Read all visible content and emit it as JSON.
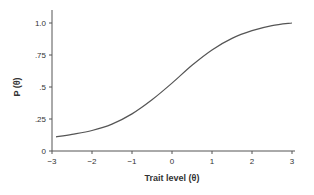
{
  "chart_data": {
    "type": "line",
    "title": "",
    "xlabel": "Trait level (θ)",
    "ylabel": "P (θ)",
    "xlim": [
      -3,
      3
    ],
    "ylim": [
      0,
      1.0
    ],
    "xticks": [
      "−3",
      "−2",
      "−1",
      "0",
      "1",
      "2",
      "3"
    ],
    "yticks": [
      "0",
      ".25",
      ".5",
      ".75",
      "1.0"
    ],
    "grid": false,
    "series": [
      {
        "name": "Item characteristic curve",
        "x": [
          -3,
          -2.5,
          -2,
          -1.5,
          -1,
          -0.5,
          0,
          0.5,
          1,
          1.5,
          2,
          2.5,
          3
        ],
        "y": [
          0.11,
          0.13,
          0.16,
          0.21,
          0.29,
          0.4,
          0.53,
          0.67,
          0.79,
          0.88,
          0.94,
          0.98,
          1.0
        ]
      }
    ]
  }
}
